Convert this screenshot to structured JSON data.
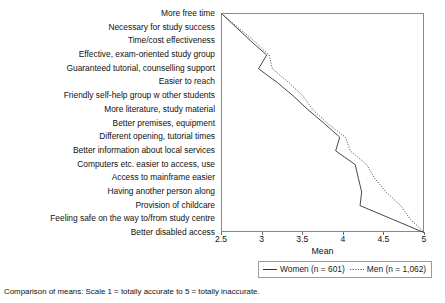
{
  "chart_data": {
    "type": "line",
    "title": "",
    "xlabel": "Mean",
    "ylabel": "",
    "xlim": [
      2.5,
      5
    ],
    "xticks": [
      2.5,
      3,
      3.5,
      4,
      4.5,
      5
    ],
    "xticklabels": [
      "2.5",
      "3",
      "3.5",
      "4",
      "4.5",
      "5"
    ],
    "grid": false,
    "orientation": "horizontal",
    "legend_position": "bottom",
    "categories": [
      "More free time",
      "Necessary for study success",
      "Time/cost effectiveness",
      "Effective, exam-oriented study group",
      "Guaranteed tutorial, counselling support",
      "Easier to reach",
      "Friendly self-help group w other students",
      "More literature, study material",
      "Better premises, equipment",
      "Different opening, tutorial times",
      "Better information about local services",
      "Computers etc. easier  to access, use",
      "Access to mainframe easier",
      "Having another person along",
      "Provision of childcare",
      "Feeling safe on the way to/from study centre",
      "Better disabled access"
    ],
    "series": [
      {
        "name": "Women (n = 601)",
        "style": "solid",
        "color": "#333333",
        "values": [
          2.5,
          2.68,
          2.86,
          3.05,
          2.95,
          3.18,
          3.38,
          3.56,
          3.76,
          3.95,
          3.9,
          4.14,
          4.18,
          4.22,
          4.2,
          4.6,
          5.0
        ]
      },
      {
        "name": "Men (n = 1,062)",
        "style": "dotted",
        "color": "#555555",
        "values": [
          2.5,
          2.7,
          2.9,
          3.08,
          3.12,
          3.32,
          3.5,
          3.62,
          3.8,
          4.02,
          4.08,
          4.28,
          4.38,
          4.52,
          4.7,
          4.82,
          5.0
        ]
      }
    ]
  },
  "axis": {
    "x_title": "Mean"
  },
  "legend": {
    "entries": [
      {
        "label": "Women (n = 601)",
        "swatch": "solid-line-swatch"
      },
      {
        "label": "Men (n = 1,062)",
        "swatch": "dotted-line-swatch"
      }
    ]
  },
  "footer": {
    "note": "Comparison of means: Scale 1 = totally accurate to 5 = totally inaccurate."
  }
}
